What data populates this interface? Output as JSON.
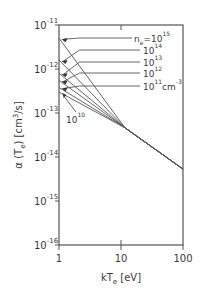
{
  "chart_data": {
    "type": "line",
    "title": "",
    "xlabel": "kTe [eV]",
    "ylabel": "α (Te) [cm³/s]",
    "xscale": "log",
    "yscale": "log",
    "xlim": [
      1,
      100
    ],
    "ylim": [
      1e-16,
      1e-11
    ],
    "x_ticks": [
      {
        "value": 1,
        "label": "1"
      },
      {
        "value": 10,
        "label": "10"
      },
      {
        "value": 100,
        "label": "100"
      }
    ],
    "y_ticks": [
      {
        "value": 1e-11,
        "base": "10",
        "exp": "-11"
      },
      {
        "value": 1e-12,
        "base": "10",
        "exp": "-12"
      },
      {
        "value": 1e-13,
        "base": "10",
        "exp": "-13"
      },
      {
        "value": 1e-14,
        "base": "10",
        "exp": "-14"
      },
      {
        "value": 1e-15,
        "base": "10",
        "exp": "-15"
      },
      {
        "value": 1e-16,
        "base": "10",
        "exp": "-16"
      }
    ],
    "grid": false,
    "series": [
      {
        "name": "ne=10^15",
        "label_base": "n",
        "label_sub": "e",
        "label_mid": "=10",
        "label_exp": "15",
        "label_unit": "",
        "x": [
          1,
          11.6,
          100
        ],
        "y": [
          5e-12,
          4.6e-14,
          5.3e-15
        ],
        "label_y": 38
      },
      {
        "name": "ne=10^14",
        "label_base": "",
        "label_sub": "",
        "label_mid": "10",
        "label_exp": "14",
        "label_unit": "",
        "x": [
          1,
          11.6,
          100
        ],
        "y": [
          1.6e-12,
          4.6e-14,
          5.3e-15
        ],
        "label_y": 50
      },
      {
        "name": "ne=10^13",
        "label_base": "",
        "label_sub": "",
        "label_mid": "10",
        "label_exp": "13",
        "label_unit": "",
        "x": [
          1,
          11.6,
          100
        ],
        "y": [
          8e-13,
          4.6e-14,
          5.3e-15
        ],
        "label_y": 62
      },
      {
        "name": "ne=10^12",
        "label_base": "",
        "label_sub": "",
        "label_mid": "10",
        "label_exp": "12",
        "label_unit": "",
        "x": [
          1,
          11.6,
          100
        ],
        "y": [
          5.5e-13,
          4.6e-14,
          5.3e-15
        ],
        "label_y": 73
      },
      {
        "name": "ne=10^11 cm^-3",
        "label_base": "",
        "label_sub": "",
        "label_mid": "10",
        "label_exp": "11",
        "label_unit": "cm",
        "label_unit_exp": "-3",
        "x": [
          1,
          11.6,
          100
        ],
        "y": [
          3.8e-13,
          4.6e-14,
          5.3e-15
        ],
        "label_y": 86
      },
      {
        "name": "ne=10^10",
        "label_base": "",
        "label_sub": "",
        "label_mid": "10",
        "label_exp": "10",
        "label_unit": "",
        "x": [
          1,
          11.6,
          100
        ],
        "y": [
          3e-13,
          4.6e-14,
          5.3e-15
        ],
        "label_y": 119
      }
    ],
    "annotations": [
      "n_e=10^15",
      "10^14",
      "10^13",
      "10^12",
      "10^11 cm^-3",
      "10^10"
    ],
    "legend": "inline labels with leader arrows"
  }
}
